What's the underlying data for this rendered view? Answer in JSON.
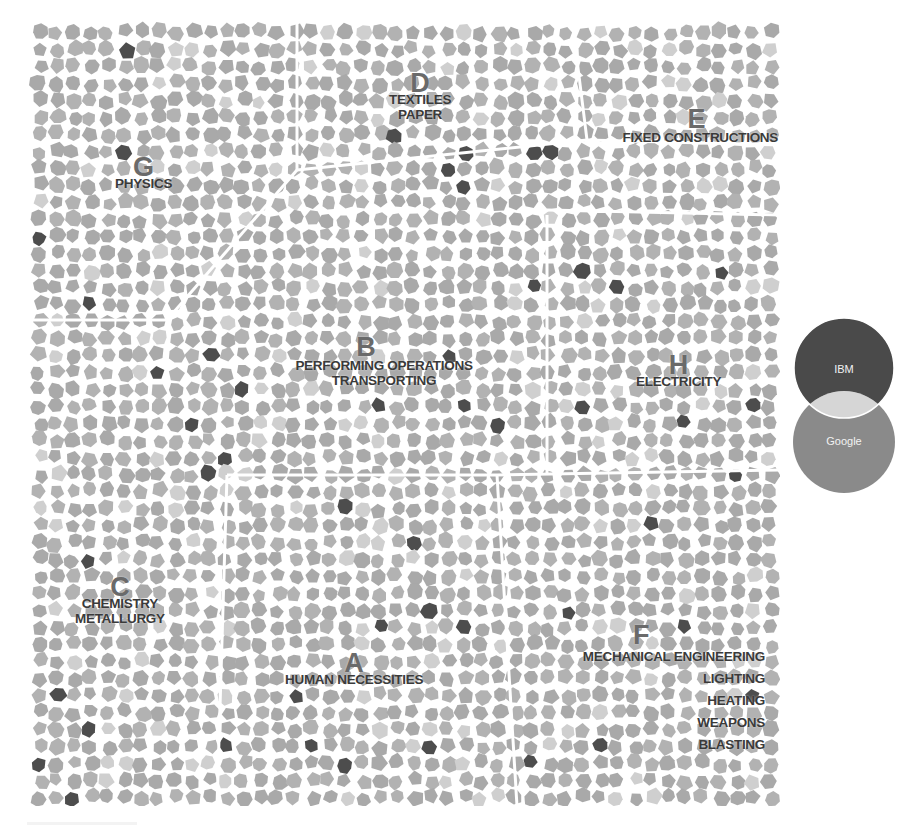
{
  "map": {
    "background_cell_color": "#a9a9a9",
    "light_cell_color": "#cfcfcf",
    "dark_cell_color": "#4d4d4d",
    "gap_color": "#ffffff",
    "regions": [
      {
        "id": "A",
        "letter": "A",
        "lines": [
          "HUMAN NECESSITIES"
        ]
      },
      {
        "id": "B",
        "letter": "B",
        "lines": [
          "PERFORMING OPERATIONS",
          "TRANSPORTING"
        ]
      },
      {
        "id": "C",
        "letter": "C",
        "lines": [
          "CHEMISTRY",
          "METALLURGY"
        ]
      },
      {
        "id": "D",
        "letter": "D",
        "lines": [
          "TEXTILES",
          "PAPER"
        ]
      },
      {
        "id": "E",
        "letter": "E",
        "lines": [
          "FIXED CONSTRUCTIONS"
        ]
      },
      {
        "id": "F",
        "letter": "F",
        "lines": [
          "MECHANICAL ENGINEERING",
          "LIGHTING",
          "HEATING",
          "WEAPONS",
          "BLASTING"
        ]
      },
      {
        "id": "G",
        "letter": "G",
        "lines": [
          "PHYSICS"
        ]
      },
      {
        "id": "H",
        "letter": "H",
        "lines": [
          "ELECTRICITY"
        ]
      }
    ]
  },
  "legend": {
    "top_label": "IBM",
    "bottom_label": "Google",
    "top_color": "#4a4a4a",
    "bottom_color": "#8a8a8a",
    "overlap_color": "#d6d6d6"
  }
}
